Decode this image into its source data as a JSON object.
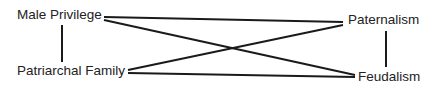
{
  "diagram": {
    "nodes": [
      {
        "id": "male_privilege",
        "label": "Male Privilege"
      },
      {
        "id": "patriarchal_family",
        "label": "Patriarchal Family"
      },
      {
        "id": "paternalism",
        "label": "Paternalism"
      },
      {
        "id": "feudalism",
        "label": "Feudalism"
      }
    ],
    "edges": [
      {
        "from": "male_privilege",
        "to": "patriarchal_family"
      },
      {
        "from": "male_privilege",
        "to": "paternalism"
      },
      {
        "from": "male_privilege",
        "to": "feudalism"
      },
      {
        "from": "patriarchal_family",
        "to": "paternalism"
      },
      {
        "from": "patriarchal_family",
        "to": "feudalism"
      },
      {
        "from": "paternalism",
        "to": "feudalism"
      }
    ],
    "line_color": "#1a1a1a"
  }
}
